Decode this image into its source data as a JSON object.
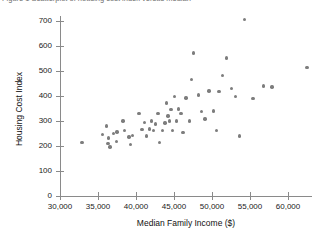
{
  "figure": {
    "caption_sliver": "Figure 1  Scatterplot of housing cost index versus median family income"
  },
  "chart_data": {
    "type": "scatter",
    "title": "",
    "xlabel": "Median Family Income ($)",
    "ylabel": "Housing Cost Index",
    "xlim": [
      30000,
      66000
    ],
    "ylim": [
      0,
      700
    ],
    "xticks": [
      30000,
      35000,
      40000,
      45000,
      50000,
      55000,
      60000
    ],
    "xtick_labels": [
      "30,000",
      "35,000",
      "40,000",
      "45,000",
      "50,000",
      "55,000",
      "60,000"
    ],
    "yticks": [
      0,
      100,
      200,
      300,
      400,
      500,
      600,
      700
    ],
    "ytick_labels": [
      "0",
      "100",
      "200",
      "300",
      "400",
      "500",
      "600",
      "700"
    ],
    "grid": false,
    "legend": null,
    "marker_color": "#7d7d7d",
    "marker_size": 3.4,
    "axis_color": "#8a8a8a",
    "points": [
      {
        "x": 32900,
        "y": 215
      },
      {
        "x": 35600,
        "y": 245
      },
      {
        "x": 36100,
        "y": 280
      },
      {
        "x": 36300,
        "y": 210
      },
      {
        "x": 36400,
        "y": 232
      },
      {
        "x": 36600,
        "y": 196
      },
      {
        "x": 37000,
        "y": 250
      },
      {
        "x": 37400,
        "y": 218
      },
      {
        "x": 37500,
        "y": 256
      },
      {
        "x": 38300,
        "y": 300
      },
      {
        "x": 38500,
        "y": 262
      },
      {
        "x": 39100,
        "y": 236
      },
      {
        "x": 39300,
        "y": 205
      },
      {
        "x": 39500,
        "y": 243
      },
      {
        "x": 40400,
        "y": 330
      },
      {
        "x": 40800,
        "y": 266
      },
      {
        "x": 41100,
        "y": 295
      },
      {
        "x": 41400,
        "y": 240
      },
      {
        "x": 41800,
        "y": 268
      },
      {
        "x": 42000,
        "y": 300
      },
      {
        "x": 42300,
        "y": 262
      },
      {
        "x": 42600,
        "y": 288
      },
      {
        "x": 42900,
        "y": 330
      },
      {
        "x": 43100,
        "y": 215
      },
      {
        "x": 43500,
        "y": 262
      },
      {
        "x": 43800,
        "y": 292
      },
      {
        "x": 44000,
        "y": 372
      },
      {
        "x": 44200,
        "y": 320
      },
      {
        "x": 44400,
        "y": 300
      },
      {
        "x": 44600,
        "y": 345
      },
      {
        "x": 44800,
        "y": 262
      },
      {
        "x": 45100,
        "y": 398
      },
      {
        "x": 45300,
        "y": 300
      },
      {
        "x": 45600,
        "y": 348
      },
      {
        "x": 45900,
        "y": 330
      },
      {
        "x": 46200,
        "y": 255
      },
      {
        "x": 46600,
        "y": 392
      },
      {
        "x": 47000,
        "y": 300
      },
      {
        "x": 47300,
        "y": 466
      },
      {
        "x": 47600,
        "y": 572
      },
      {
        "x": 48200,
        "y": 404
      },
      {
        "x": 48600,
        "y": 338
      },
      {
        "x": 49100,
        "y": 308
      },
      {
        "x": 49600,
        "y": 420
      },
      {
        "x": 50200,
        "y": 340
      },
      {
        "x": 50600,
        "y": 262
      },
      {
        "x": 50900,
        "y": 418
      },
      {
        "x": 51400,
        "y": 482
      },
      {
        "x": 51900,
        "y": 552
      },
      {
        "x": 52600,
        "y": 430
      },
      {
        "x": 53100,
        "y": 398
      },
      {
        "x": 53600,
        "y": 240
      },
      {
        "x": 54300,
        "y": 705
      },
      {
        "x": 55400,
        "y": 390
      },
      {
        "x": 56800,
        "y": 440
      },
      {
        "x": 57900,
        "y": 436
      },
      {
        "x": 62500,
        "y": 515
      }
    ]
  }
}
